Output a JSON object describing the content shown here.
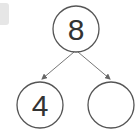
{
  "diagram": {
    "type": "number-bond",
    "whole": {
      "value": "8"
    },
    "parts": [
      {
        "value": "4"
      },
      {
        "value": ""
      }
    ],
    "colors": {
      "stroke": "#555555",
      "text": "#333333",
      "tab": "#e6e6e6"
    }
  }
}
